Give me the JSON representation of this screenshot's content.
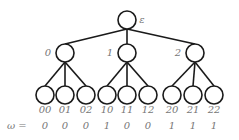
{
  "tree": {
    "root": {
      "label": "ε",
      "x": 127,
      "y": 20
    },
    "level1": [
      {
        "label": "0",
        "x": 65,
        "y": 53
      },
      {
        "label": "1",
        "x": 127,
        "y": 53
      },
      {
        "label": "2",
        "x": 195,
        "y": 53
      }
    ],
    "leaves": [
      {
        "label": "00",
        "omega": "0",
        "x": 45,
        "parent": 0
      },
      {
        "label": "01",
        "omega": "0",
        "x": 65,
        "parent": 0
      },
      {
        "label": "02",
        "omega": "0",
        "x": 86,
        "parent": 0
      },
      {
        "label": "10",
        "omega": "1",
        "x": 107,
        "parent": 1
      },
      {
        "label": "11",
        "omega": "0",
        "x": 127,
        "parent": 1
      },
      {
        "label": "12",
        "omega": "0",
        "x": 148,
        "parent": 1
      },
      {
        "label": "20",
        "omega": "1",
        "x": 172,
        "parent": 2
      },
      {
        "label": "21",
        "omega": "1",
        "x": 193,
        "parent": 2
      },
      {
        "label": "22",
        "omega": "1",
        "x": 214,
        "parent": 2
      }
    ],
    "omega_prefix": "ω =",
    "leaf_y": 95,
    "radius": 9
  },
  "colors": {
    "stroke": "#1a1a1a",
    "label": "#777777"
  }
}
